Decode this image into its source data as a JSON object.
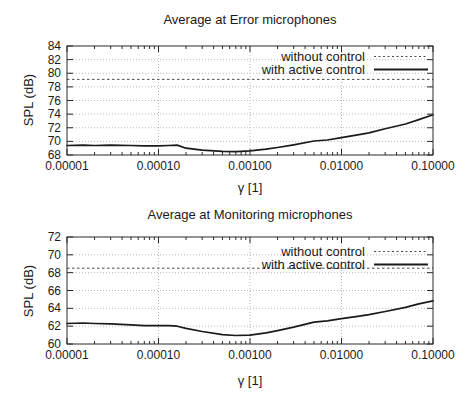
{
  "colors": {
    "background": "#ffffff",
    "line": "#1a1a1a",
    "dashed_line": "#4a4a4a",
    "grid": "#b8b8b8",
    "text": "#1a1a1a"
  },
  "chart_data": [
    {
      "type": "line",
      "title": "Average at Error microphones",
      "xlabel": "γ [1]",
      "ylabel": "SPL (dB)",
      "x_scale": "log",
      "xlim": [
        1e-05,
        0.1
      ],
      "ylim": [
        68,
        84
      ],
      "yticks": [
        68,
        70,
        72,
        74,
        76,
        78,
        80,
        82,
        84
      ],
      "xticks": [
        1e-05,
        0.0001,
        0.001,
        0.01,
        0.1
      ],
      "xtick_labels": [
        "0.00001",
        "0.00010",
        "0.00100",
        "0.01000",
        "0.10000"
      ],
      "grid": true,
      "legend_position": "top-right-inside",
      "series": [
        {
          "name": "without control",
          "style": "dashed",
          "constant_value": 79.1
        },
        {
          "name": "with active control",
          "style": "solid",
          "x": [
            1e-05,
            1.5e-05,
            2e-05,
            3e-05,
            5e-05,
            7e-05,
            0.0001,
            0.00013,
            0.00016,
            0.0002,
            0.0003,
            0.0005,
            0.0007,
            0.001,
            0.0015,
            0.002,
            0.003,
            0.005,
            0.007,
            0.01,
            0.015,
            0.02,
            0.03,
            0.05,
            0.07,
            0.1
          ],
          "y": [
            69.4,
            69.45,
            69.4,
            69.45,
            69.4,
            69.35,
            69.35,
            69.4,
            69.45,
            69.0,
            68.7,
            68.55,
            68.5,
            68.6,
            68.85,
            69.1,
            69.5,
            70.05,
            70.2,
            70.55,
            70.95,
            71.25,
            71.85,
            72.55,
            73.2,
            73.9
          ]
        }
      ]
    },
    {
      "type": "line",
      "title": "Average at Monitoring microphones",
      "xlabel": "γ [1]",
      "ylabel": "SPL (dB)",
      "x_scale": "log",
      "xlim": [
        1e-05,
        0.1
      ],
      "ylim": [
        60,
        72
      ],
      "yticks": [
        60,
        62,
        64,
        66,
        68,
        70,
        72
      ],
      "xticks": [
        1e-05,
        0.0001,
        0.001,
        0.01,
        0.1
      ],
      "xtick_labels": [
        "0.00001",
        "0.00010",
        "0.00100",
        "0.01000",
        "0.10000"
      ],
      "grid": true,
      "legend_position": "top-right-inside",
      "series": [
        {
          "name": "without control",
          "style": "dashed",
          "constant_value": 68.5
        },
        {
          "name": "with active control",
          "style": "solid",
          "x": [
            1e-05,
            1.5e-05,
            2e-05,
            3e-05,
            5e-05,
            7e-05,
            0.0001,
            0.00013,
            0.00016,
            0.0002,
            0.0003,
            0.0005,
            0.0007,
            0.001,
            0.0015,
            0.002,
            0.003,
            0.005,
            0.007,
            0.01,
            0.015,
            0.02,
            0.03,
            0.05,
            0.07,
            0.1
          ],
          "y": [
            62.3,
            62.35,
            62.3,
            62.25,
            62.15,
            62.05,
            62.05,
            62.05,
            62.0,
            61.75,
            61.4,
            61.05,
            60.95,
            61.0,
            61.25,
            61.5,
            61.9,
            62.45,
            62.6,
            62.85,
            63.1,
            63.3,
            63.65,
            64.1,
            64.5,
            64.85
          ]
        }
      ]
    }
  ]
}
